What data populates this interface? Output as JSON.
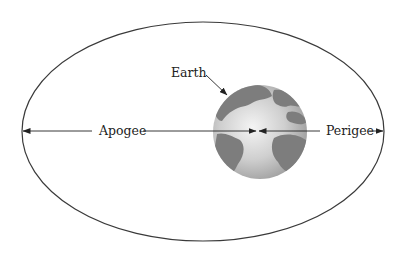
{
  "diagram": {
    "labels": {
      "earth": "Earth",
      "apogee": "Apogee",
      "perigee": "Perigee"
    },
    "colors": {
      "orbit_line": "#3a3a3a",
      "earth_ocean_light": "#e2e2e2",
      "earth_ocean_dark": "#9a9a9a",
      "earth_land": "#7a7a7a",
      "arrow": "#222222"
    },
    "geometry": {
      "orbit": {
        "cx": 203,
        "cy": 131.5,
        "rx": 181,
        "ry": 109.5
      },
      "earth": {
        "cx": 260,
        "cy": 132,
        "r": 47
      },
      "axis_y": 131,
      "focus_x": 257
    }
  }
}
